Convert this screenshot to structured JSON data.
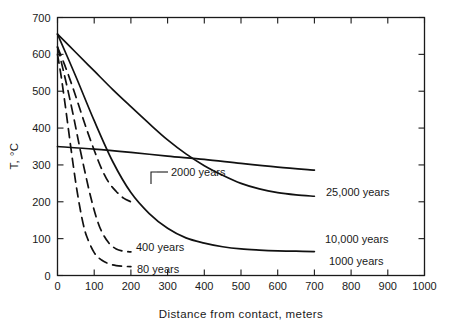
{
  "chart_data": {
    "type": "line",
    "title": "",
    "xlabel": "Distance from contact, meters",
    "ylabel": "T, °C",
    "xlim": [
      0,
      1000
    ],
    "ylim": [
      0,
      700
    ],
    "xticks": [
      0,
      100,
      200,
      300,
      400,
      500,
      600,
      700,
      800,
      900,
      1000
    ],
    "yticks": [
      0,
      100,
      200,
      300,
      400,
      500,
      600,
      700
    ],
    "xticklabels": [
      "0",
      "100",
      "200",
      "300",
      "400",
      "500",
      "600",
      "700",
      "800",
      "900",
      "1000"
    ],
    "yticklabels": [
      "0",
      "100",
      "200",
      "300",
      "400",
      "500",
      "600",
      "700"
    ],
    "grid": false,
    "legend_position": "inline-annotations",
    "series": [
      {
        "name": "80 years",
        "style": "dashed",
        "label": "80 years",
        "x": [
          0,
          10,
          20,
          30,
          40,
          50,
          60,
          70,
          80,
          100,
          120,
          140,
          160,
          180,
          200
        ],
        "y": [
          600,
          540,
          470,
          395,
          320,
          250,
          190,
          140,
          105,
          62,
          42,
          32,
          27,
          25,
          24
        ]
      },
      {
        "name": "400 years",
        "style": "dashed",
        "label": "400 years",
        "x": [
          0,
          15,
          30,
          45,
          60,
          75,
          90,
          105,
          120,
          140,
          160,
          180,
          200
        ],
        "y": [
          620,
          560,
          495,
          425,
          350,
          280,
          215,
          160,
          120,
          88,
          72,
          66,
          64
        ]
      },
      {
        "name": "2000 years",
        "style": "dashed",
        "label": "2000 years",
        "x": [
          0,
          20,
          40,
          60,
          80,
          100,
          120,
          140,
          160,
          180,
          200
        ],
        "y": [
          620,
          570,
          515,
          455,
          395,
          340,
          290,
          252,
          228,
          210,
          200
        ]
      },
      {
        "name": "1000 years",
        "style": "solid",
        "label": "1000 years",
        "x": [
          0,
          50,
          100,
          150,
          200,
          250,
          300,
          350,
          400,
          450,
          500,
          550,
          600,
          650,
          700
        ],
        "y": [
          655,
          540,
          420,
          310,
          225,
          168,
          128,
          102,
          88,
          78,
          72,
          69,
          67,
          66,
          65
        ]
      },
      {
        "name": "10,000 years",
        "style": "solid",
        "label": "10,000 years",
        "x": [
          0,
          50,
          100,
          150,
          200,
          250,
          300,
          350,
          400,
          450,
          500,
          550,
          600,
          650,
          700
        ],
        "y": [
          655,
          605,
          555,
          505,
          458,
          412,
          368,
          330,
          298,
          272,
          250,
          235,
          225,
          219,
          215
        ]
      },
      {
        "name": "25,000 years",
        "style": "solid",
        "label": "25,000 years",
        "x": [
          0,
          100,
          200,
          300,
          400,
          500,
          600,
          700
        ],
        "y": [
          350,
          343,
          334,
          324,
          315,
          304,
          294,
          286
        ]
      }
    ],
    "annotations": [
      {
        "text": "2000 years",
        "target_series": "2000 years",
        "has_leader": true
      },
      {
        "text": "400 years",
        "target_series": "400 years",
        "has_leader": false
      },
      {
        "text": "80 years",
        "target_series": "80 years",
        "has_leader": false
      },
      {
        "text": "1000 years",
        "target_series": "1000 years",
        "has_leader": false
      },
      {
        "text": "10,000 years",
        "target_series": "10,000 years",
        "has_leader": false
      },
      {
        "text": "25,000 years",
        "target_series": "25,000 years",
        "has_leader": false
      }
    ]
  },
  "colors": {
    "background": "#ffffff",
    "ink": "#1a1a1a",
    "curve": "#111111"
  }
}
